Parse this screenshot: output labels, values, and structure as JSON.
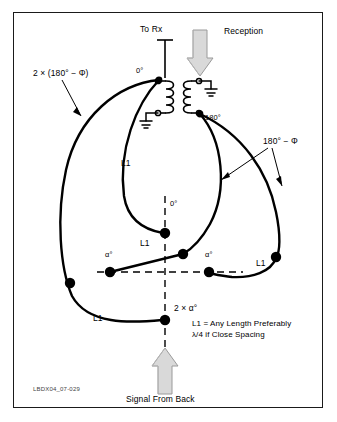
{
  "figure": {
    "id_code": "LBDX04_07-029",
    "border_color": "#1a1a1a",
    "line_color": "#000000",
    "arrow_fill": "#d9d9d9",
    "arrow_stroke": "#8c8c8c"
  },
  "labels": {
    "to_rx": "To Rx",
    "reception": "Reception",
    "signal_from_back": "Signal From Back",
    "phase_top": "0°",
    "phase_transformer_out": "180°",
    "phase_center": "0°",
    "phase_left_alpha": "α°",
    "phase_right_alpha": "α°",
    "phase_bottom": "2 × α°",
    "left_leader": "2 × (180° − Φ)",
    "right_leader": "180° − Φ",
    "wire_l1_left": "L1",
    "wire_l1_center": "L1",
    "wire_l1_right": "L1",
    "wire_l1_bottom": "L1",
    "note_line1": "L1 = Any Length Preferably",
    "note_line2": "λ/4 if Close Spacing"
  }
}
